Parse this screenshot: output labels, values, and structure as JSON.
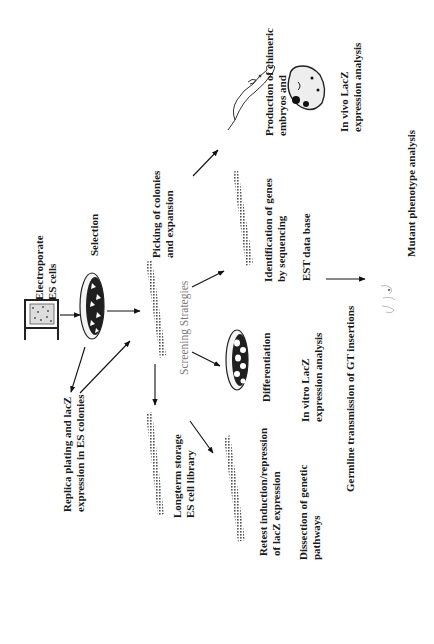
{
  "diagram": {
    "orientation": "rotated 90deg counter-clockwise",
    "steps": {
      "electroporate": [
        "Electroporate",
        "ES cells"
      ],
      "selection": "Selection",
      "picking": [
        "Picking of colonies",
        "and expansion"
      ],
      "screening": "Screening Strategies",
      "replica": [
        "Replica plating and lacZ",
        "expression in ES colonies"
      ],
      "longterm": [
        "Longterm storage",
        "ES cell library"
      ],
      "retest": [
        "Retest induction/repression",
        "of lacZ expression"
      ],
      "dissection": [
        "Dissection of genetic",
        "pathways"
      ],
      "differentiation": "Differentiation",
      "invitro": [
        "In vitro LacZ",
        "expression analysis"
      ],
      "germline": "Germline transmission of GT insertions",
      "identification": [
        "Identification of genes",
        "by sequencing"
      ],
      "est": "EST data base",
      "chimeric": [
        "Production of chimeric",
        "embryos and"
      ],
      "invivo": [
        "In vivo LacZ",
        "expression analysis"
      ],
      "mutant": "Mutant phenotype analysis"
    },
    "icons": [
      "electroporation-cuvette",
      "selection-dish",
      "colony-plate",
      "differentiation-dish",
      "mouse",
      "embryo",
      "mutant-mice"
    ]
  }
}
